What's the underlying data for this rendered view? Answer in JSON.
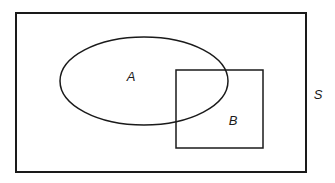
{
  "diagram": {
    "type": "venn-diagram",
    "background_color": "#ffffff",
    "stroke_color": "#1a1a1a",
    "universal_set": {
      "name": "universal-set",
      "label": "S",
      "shape": "rectangle",
      "x": 16,
      "y": 13,
      "width": 290,
      "height": 159,
      "stroke_width": 2,
      "label_x": 318,
      "label_y": 96
    },
    "set_a": {
      "name": "set-a",
      "label": "A",
      "shape": "ellipse",
      "cx": 144,
      "cy": 81,
      "rx": 84,
      "ry": 44,
      "stroke_width": 1.5,
      "label_x": 131,
      "label_y": 78
    },
    "set_b": {
      "name": "set-b",
      "label": "B",
      "shape": "rectangle",
      "x": 176,
      "y": 70,
      "width": 87,
      "height": 78,
      "stroke_width": 1.5,
      "label_x": 233,
      "label_y": 122
    },
    "relationship": "A and B overlap; both are contained within S"
  }
}
